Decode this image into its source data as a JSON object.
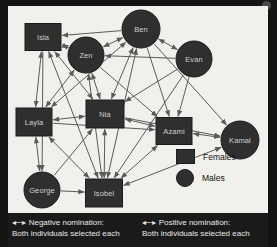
{
  "figure": {
    "type": "sociogram",
    "node_shapes": {
      "female": "square",
      "male": "circle"
    },
    "node_fill": "#2f2f2f",
    "node_text_color": "#cfcfcf",
    "panel_background": "#f2f0ec",
    "edge_color": "#5a5a5a"
  },
  "nodes": [
    {
      "id": "isla",
      "label": "Isla",
      "sex": "female",
      "shape": "square",
      "x": 35,
      "y": 31,
      "w": 36,
      "h": 27
    },
    {
      "id": "ben",
      "label": "Ben",
      "sex": "male",
      "shape": "circle",
      "x": 133,
      "y": 23,
      "r": 19
    },
    {
      "id": "zen",
      "label": "Zen",
      "sex": "male",
      "shape": "circle",
      "x": 78,
      "y": 49,
      "r": 18
    },
    {
      "id": "evan",
      "label": "Evan",
      "sex": "male",
      "shape": "circle",
      "x": 186,
      "y": 53,
      "r": 18
    },
    {
      "id": "layla",
      "label": "Layla",
      "sex": "female",
      "shape": "square",
      "x": 26,
      "y": 116,
      "w": 36,
      "h": 28
    },
    {
      "id": "nia",
      "label": "Nia",
      "sex": "female",
      "shape": "square",
      "x": 97,
      "y": 108,
      "w": 38,
      "h": 28
    },
    {
      "id": "azami",
      "label": "Azami",
      "sex": "female",
      "shape": "square",
      "x": 166,
      "y": 125,
      "w": 36,
      "h": 27
    },
    {
      "id": "kamal",
      "label": "Kamal",
      "sex": "male",
      "shape": "circle",
      "x": 232,
      "y": 134,
      "r": 19
    },
    {
      "id": "george",
      "label": "George",
      "sex": "male",
      "shape": "circle",
      "x": 34,
      "y": 184,
      "r": 18
    },
    {
      "id": "isobel",
      "label": "Isobel",
      "sex": "female",
      "shape": "square",
      "x": 96,
      "y": 187,
      "w": 37,
      "h": 28
    }
  ],
  "edges": [
    {
      "from": "ben",
      "to": "isla",
      "arrows": "single"
    },
    {
      "from": "isla",
      "to": "zen",
      "arrows": "double"
    },
    {
      "from": "isla",
      "to": "layla",
      "arrows": "double"
    },
    {
      "from": "isla",
      "to": "nia",
      "arrows": "double"
    },
    {
      "from": "isla",
      "to": "isobel",
      "arrows": "double"
    },
    {
      "from": "isla",
      "to": "george",
      "arrows": "single"
    },
    {
      "from": "zen",
      "to": "ben",
      "arrows": "double"
    },
    {
      "from": "zen",
      "to": "nia",
      "arrows": "double"
    },
    {
      "from": "zen",
      "to": "layla",
      "arrows": "double"
    },
    {
      "from": "zen",
      "to": "isobel",
      "arrows": "double"
    },
    {
      "from": "zen",
      "to": "azami",
      "arrows": "single"
    },
    {
      "from": "ben",
      "to": "evan",
      "arrows": "double"
    },
    {
      "from": "ben",
      "to": "nia",
      "arrows": "double"
    },
    {
      "from": "ben",
      "to": "layla",
      "arrows": "double"
    },
    {
      "from": "ben",
      "to": "isobel",
      "arrows": "double"
    },
    {
      "from": "ben",
      "to": "azami",
      "arrows": "single"
    },
    {
      "from": "ben",
      "to": "kamal",
      "arrows": "single"
    },
    {
      "from": "evan",
      "to": "zen",
      "arrows": "single"
    },
    {
      "from": "evan",
      "to": "nia",
      "arrows": "single"
    },
    {
      "from": "evan",
      "to": "azami",
      "arrows": "single"
    },
    {
      "from": "evan",
      "to": "isobel",
      "arrows": "single"
    },
    {
      "from": "layla",
      "to": "nia",
      "arrows": "double"
    },
    {
      "from": "layla",
      "to": "george",
      "arrows": "double"
    },
    {
      "from": "layla",
      "to": "isobel",
      "arrows": "double"
    },
    {
      "from": "layla",
      "to": "azami",
      "arrows": "single"
    },
    {
      "from": "nia",
      "to": "azami",
      "arrows": "double"
    },
    {
      "from": "nia",
      "to": "isobel",
      "arrows": "double"
    },
    {
      "from": "nia",
      "to": "kamal",
      "arrows": "single"
    },
    {
      "from": "azami",
      "to": "kamal",
      "arrows": "double"
    },
    {
      "from": "azami",
      "to": "isobel",
      "arrows": "double"
    },
    {
      "from": "isobel",
      "to": "kamal",
      "arrows": "double"
    },
    {
      "from": "george",
      "to": "isobel",
      "arrows": "single"
    },
    {
      "from": "george",
      "to": "nia",
      "arrows": "single"
    }
  ],
  "legend": {
    "females_label": "Females",
    "males_label": "Males"
  },
  "captions": {
    "left": {
      "arrow": "◂─▸",
      "title": "Negative nomination:",
      "detail": "Both individuals selected each"
    },
    "right": {
      "arrow": "◂─▸",
      "title": "Positive nomination:",
      "detail": "Both individuals selected each"
    }
  }
}
